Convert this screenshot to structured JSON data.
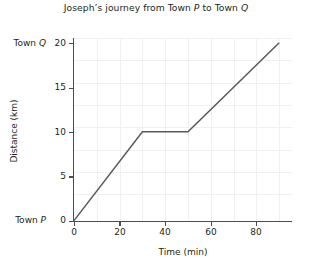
{
  "chart_data": {
    "type": "line",
    "title_parts": {
      "before_p": "Joseph’s journey from Town ",
      "p": "P",
      "between": " to Town ",
      "q": "Q"
    },
    "xlabel": "Time (min)",
    "ylabel": "Distance (km)",
    "xlim": [
      0,
      96
    ],
    "ylim": [
      0,
      21
    ],
    "xticks": [
      "0",
      "20",
      "40",
      "60",
      "80"
    ],
    "xtick_values": [
      0,
      20,
      40,
      60,
      80
    ],
    "yticks": [
      "0",
      "5",
      "10",
      "15",
      "20"
    ],
    "ytick_values": [
      0,
      5,
      10,
      15,
      20
    ],
    "grid": true,
    "legend": "none",
    "x": [
      0,
      30,
      50,
      90
    ],
    "values": [
      0,
      10,
      10,
      20
    ],
    "series": [
      {
        "name": "Joseph's journey",
        "points": [
          {
            "x": 0,
            "y": 0
          },
          {
            "x": 30,
            "y": 10
          },
          {
            "x": 50,
            "y": 10
          },
          {
            "x": 90,
            "y": 20
          }
        ]
      }
    ],
    "annotations": [
      {
        "name": "town-p",
        "text": "Town P",
        "italic_part": "P",
        "at_y": 0
      },
      {
        "name": "town-q",
        "text": "Town Q",
        "italic_part": "Q",
        "at_y": 20
      }
    ],
    "line_color": "#595959"
  },
  "annotations": {
    "town_p_prefix": "Town ",
    "town_p_letter": "P",
    "town_q_prefix": "Town ",
    "town_q_letter": "Q"
  }
}
